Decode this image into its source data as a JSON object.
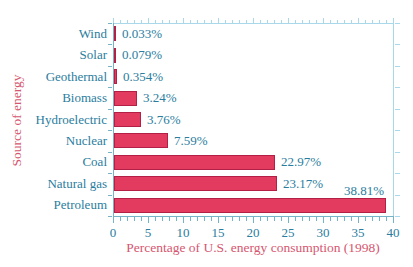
{
  "figure": {
    "kind": "textbook-bar-chart-figure",
    "background": "#ffffff"
  },
  "chart_data": {
    "type": "bar",
    "orientation": "horizontal",
    "title": "",
    "xlabel": "Percentage of U.S. energy consumption (1998)",
    "ylabel": "Source of energy",
    "categories": [
      "Wind",
      "Solar",
      "Geothermal",
      "Biomass",
      "Hydroelectric",
      "Nuclear",
      "Coal",
      "Natural gas",
      "Petroleum"
    ],
    "values": [
      0.033,
      0.079,
      0.354,
      3.24,
      3.76,
      7.59,
      22.97,
      23.17,
      38.81
    ],
    "value_labels": [
      "0.033%",
      "0.079%",
      "0.354%",
      "3.24%",
      "3.76%",
      "7.59%",
      "22.97%",
      "23.17%",
      "38.81%"
    ],
    "label_above_indices": [
      8
    ],
    "xlim": [
      0,
      40
    ],
    "x_major_ticks": [
      0,
      5,
      10,
      15,
      20,
      25,
      30,
      35,
      40
    ],
    "x_minor_tick_step": 1,
    "grid": false,
    "legend": null,
    "colors": {
      "bar_fill": "#e33a5f",
      "bar_border": "#b32045",
      "label_text": "#2a7d9e",
      "axis_title_text": "#d6566f",
      "frame_light": "#a8d8e9",
      "axis_teal": "#74b3c8",
      "background": "#ffffff"
    }
  }
}
